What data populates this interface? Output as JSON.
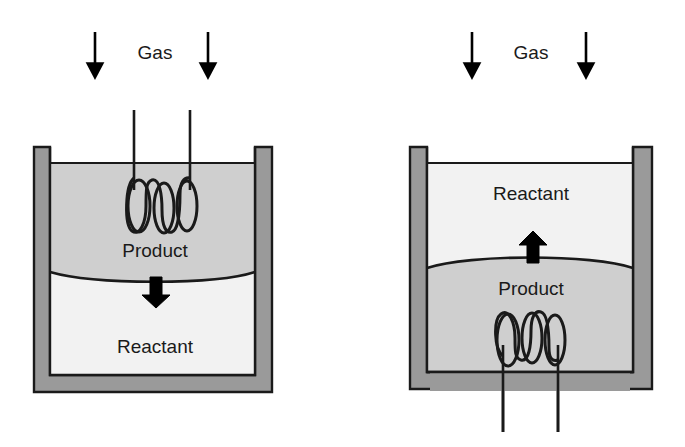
{
  "figure": {
    "background_color": "#ffffff",
    "width": 685,
    "height": 447
  },
  "colors": {
    "wall_fill": "#9a9a9a",
    "wall_stroke": "#1a1a1a",
    "product_fill": "#cfcfcf",
    "reactant_fill": "#f2f2f2",
    "outline": "#1a1a1a",
    "text": "#1a1a1a",
    "arrow": "#000000"
  },
  "panels": [
    {
      "id": "left-panel",
      "name": "coil-above-interface",
      "gas_label": "Gas",
      "gas_arrows": [
        {
          "name": "gas-arrow-left",
          "direction": "down",
          "x": 95,
          "y_start": 32,
          "y_end": 73
        },
        {
          "name": "gas-arrow-right",
          "direction": "down",
          "x": 208,
          "y_start": 32,
          "y_end": 73
        }
      ],
      "coil": {
        "name": "heating-coil",
        "position": "upper-zone",
        "loops": 3,
        "stem_orientation": "up",
        "stem_top_y": 110,
        "stems_x": [
          134,
          190
        ]
      },
      "zones": [
        {
          "name": "upper-zone",
          "label": "Product",
          "fill": "#cfcfcf",
          "label_x": 155,
          "label_y": 252
        },
        {
          "name": "lower-zone",
          "label": "Reactant",
          "fill": "#f2f2f2",
          "label_x": 155,
          "label_y": 348
        }
      ],
      "interface": {
        "name": "phase-interface",
        "curvature": "concave-up",
        "y": 272
      },
      "flow_arrow": {
        "name": "product-flow-arrow",
        "direction": "down",
        "x": 156,
        "y_start": 277,
        "y_end": 307
      }
    },
    {
      "id": "right-panel",
      "name": "coil-below-interface",
      "gas_label": "Gas",
      "gas_arrows": [
        {
          "name": "gas-arrow-left",
          "direction": "down",
          "x": 472,
          "y_start": 32,
          "y_end": 73
        },
        {
          "name": "gas-arrow-right",
          "direction": "down",
          "x": 586,
          "y_start": 32,
          "y_end": 73
        }
      ],
      "coil": {
        "name": "heating-coil",
        "position": "lower-zone",
        "loops": 3,
        "stem_orientation": "down",
        "stem_bottom_y": 432,
        "stems_x": [
          503,
          558
        ]
      },
      "zones": [
        {
          "name": "upper-zone",
          "label": "Reactant",
          "fill": "#f2f2f2",
          "label_x": 531,
          "label_y": 195
        },
        {
          "name": "lower-zone",
          "label": "Product",
          "fill": "#cfcfcf",
          "label_x": 531,
          "label_y": 290
        }
      ],
      "interface": {
        "name": "phase-interface",
        "curvature": "convex-up",
        "y": 268
      },
      "flow_arrow": {
        "name": "product-flow-arrow",
        "direction": "up",
        "x": 533,
        "y_start": 263,
        "y_end": 232
      }
    }
  ],
  "labels": {
    "gas": "Gas",
    "product": "Product",
    "reactant": "Reactant"
  }
}
